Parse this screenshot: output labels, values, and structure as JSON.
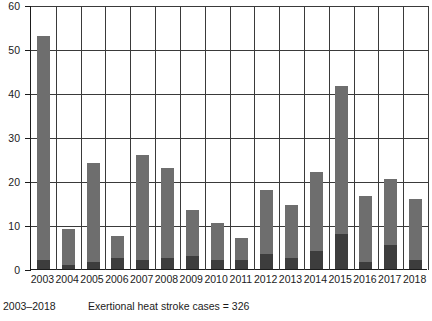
{
  "chart_data": {
    "type": "bar",
    "title": "",
    "subtitle": "",
    "xlabel": "",
    "ylabel": "",
    "ylim": [
      0,
      60
    ],
    "yticks": [
      0,
      10,
      20,
      30,
      40,
      50,
      60
    ],
    "grid": true,
    "legend_position": "none",
    "stacked": true,
    "categories": [
      "2003",
      "2004",
      "2005",
      "2006",
      "2007",
      "2008",
      "2009",
      "2010",
      "2011",
      "2012",
      "2013",
      "2014",
      "2015",
      "2016",
      "2017",
      "2018"
    ],
    "values": [
      53,
      9,
      24,
      7.5,
      26,
      23,
      13.5,
      10.5,
      7,
      18,
      14.5,
      22,
      41.5,
      16.5,
      20.5,
      16
    ],
    "series": [
      {
        "name": "lower-segment",
        "values": [
          2,
          1,
          1.5,
          2.5,
          2,
          2.5,
          3,
          2,
          2,
          3.5,
          2.5,
          4,
          8,
          1.5,
          5.5,
          2
        ]
      },
      {
        "name": "upper-segment",
        "values": [
          51,
          8,
          22.5,
          5,
          24,
          20.5,
          10.5,
          8.5,
          5,
          14.5,
          12,
          18,
          33.5,
          15,
          15,
          14
        ]
      }
    ],
    "colors": {
      "upper_segment": "#6e6e6e",
      "lower_segment": "#3d3d3d",
      "axis": "#1b1b1b",
      "grid": "#3a3a3a",
      "background": "#ffffff"
    }
  },
  "caption": {
    "range": "2003–2018",
    "note": "Exertional heat stroke cases = 326"
  }
}
